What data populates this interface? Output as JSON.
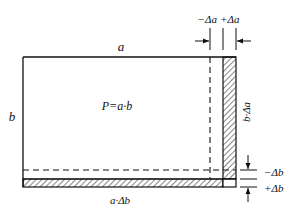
{
  "diagram": {
    "labels": {
      "side_a": "a",
      "side_b": "b",
      "area": "P=a·b",
      "minus_delta_a": "−Δa",
      "plus_delta_a": "+Δa",
      "strip_right": "b·Δa",
      "strip_bottom": "a·Δb",
      "minus_delta_b": "−Δb",
      "plus_delta_b": "+Δb"
    },
    "colors": {
      "line": "#111111",
      "background": "#ffffff"
    }
  }
}
